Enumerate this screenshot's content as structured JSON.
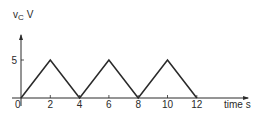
{
  "chart_data": {
    "type": "line",
    "title": "",
    "ylabel_main": "v",
    "ylabel_sub": "C",
    "ylabel_unit": "V",
    "xlabel": "time s",
    "origin_label": "0",
    "x_ticks": [
      2,
      4,
      6,
      8,
      10,
      12
    ],
    "y_ticks": [
      5
    ],
    "xlim": [
      0,
      15.5
    ],
    "ylim": [
      0,
      8.3
    ],
    "grid": false,
    "series": [
      {
        "name": "vC",
        "x": [
          0,
          2,
          4,
          6,
          8,
          10,
          12
        ],
        "y": [
          0,
          5,
          0,
          5,
          0,
          5,
          0
        ]
      }
    ]
  }
}
